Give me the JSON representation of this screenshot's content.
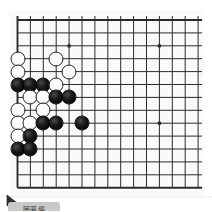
{
  "app": {
    "title": "Go Board",
    "background_color": "#ffffff"
  },
  "board": {
    "name": "go-board",
    "board_color": "#fafafa",
    "line_color": "#2b2b2b",
    "border_color": "#1a1a1a",
    "columns_visible": 15,
    "rows_visible": 14,
    "cell_size": 12.9,
    "origin_x": 8.5,
    "origin_y": 10,
    "black_color": "#000000",
    "white_color": "#ffffff",
    "star_points": [
      {
        "col": 4,
        "row": 2
      },
      {
        "col": 11,
        "row": 2
      },
      {
        "col": 11,
        "row": 8
      }
    ],
    "stones": [
      {
        "color": "white",
        "col": 0,
        "row": 3
      },
      {
        "color": "white",
        "col": 3,
        "row": 3
      },
      {
        "color": "white",
        "col": 0,
        "row": 4
      },
      {
        "color": "white",
        "col": 4,
        "row": 4
      },
      {
        "color": "black",
        "col": 0,
        "row": 5
      },
      {
        "color": "black",
        "col": 1,
        "row": 5
      },
      {
        "color": "black",
        "col": 2,
        "row": 5
      },
      {
        "color": "white",
        "col": 3,
        "row": 5
      },
      {
        "color": "white",
        "col": 1,
        "row": 6
      },
      {
        "color": "white",
        "col": 2,
        "row": 6
      },
      {
        "color": "black",
        "col": 3,
        "row": 6
      },
      {
        "color": "black",
        "col": 4,
        "row": 6
      },
      {
        "color": "white",
        "col": 0,
        "row": 7
      },
      {
        "color": "white",
        "col": 2,
        "row": 7
      },
      {
        "color": "white",
        "col": 0,
        "row": 8
      },
      {
        "color": "white",
        "col": 1,
        "row": 8
      },
      {
        "color": "black",
        "col": 2,
        "row": 8
      },
      {
        "color": "black",
        "col": 3,
        "row": 8
      },
      {
        "color": "black",
        "col": 5,
        "row": 8
      },
      {
        "color": "white",
        "col": 0,
        "row": 9
      },
      {
        "color": "black",
        "col": 1,
        "row": 9
      },
      {
        "color": "black",
        "col": 0,
        "row": 10
      },
      {
        "color": "black",
        "col": 1,
        "row": 10
      }
    ]
  },
  "cursor": {
    "name": "mouse-pointer",
    "x": 8,
    "y": 196,
    "color": "#2a2a2a"
  },
  "badge": {
    "name": "board-caption-badge",
    "text": "囲碁盤",
    "background_color": "#c9c9c9",
    "text_color": "#3a3a3a"
  }
}
